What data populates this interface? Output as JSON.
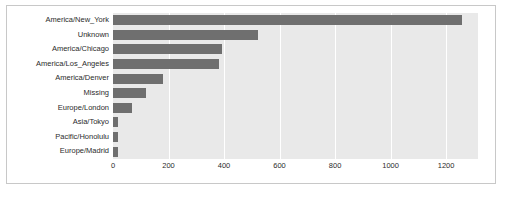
{
  "chart_data": {
    "type": "bar",
    "orientation": "horizontal",
    "title": "",
    "xlabel": "",
    "ylabel": "",
    "categories": [
      "America/New_York",
      "Unknown",
      "America/Chicago",
      "America/Los_Angeles",
      "America/Denver",
      "Missing",
      "Europe/London",
      "Asia/Tokyo",
      "Pacific/Honolulu",
      "Europe/Madrid"
    ],
    "values": [
      1258,
      521,
      394,
      382,
      181,
      120,
      70,
      18,
      17,
      17
    ],
    "xlim": [
      0,
      1315
    ],
    "ylim": [
      0,
      10
    ],
    "xticks": [
      0,
      200,
      400,
      600,
      800,
      1000,
      1200
    ],
    "xticklabels": [
      "0",
      "200",
      "400",
      "600",
      "800",
      "1000",
      "1200"
    ],
    "grid": true,
    "grid_axis": "x",
    "legend": false,
    "bar_color": "#6f6f6f",
    "plot_background": "#e9e9e9",
    "grid_color": "#ffffff",
    "figure_background": "#ffffff",
    "frame_color": "#c8c8c8"
  }
}
